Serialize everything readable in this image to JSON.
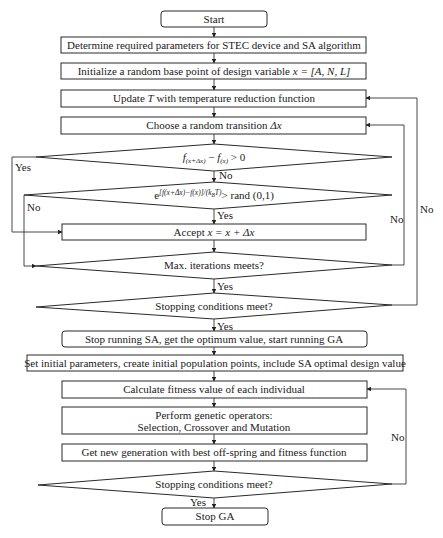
{
  "diagram": {
    "type": "flowchart",
    "nodes": {
      "start": {
        "label": "Start",
        "shape": "terminal"
      },
      "determine_params": {
        "label": "Determine required parameters for STEC device and SA algorithm",
        "shape": "process"
      },
      "initialize": {
        "label_prefix": "Initialize a random base point of design variable ",
        "label_var": "x = [A, N, L]",
        "shape": "process"
      },
      "update_t": {
        "label_prefix": "Update ",
        "label_var": "T",
        "label_suffix": " with temperature reduction function",
        "shape": "process"
      },
      "choose_transition": {
        "label_prefix": "Choose a random transition ",
        "label_var": "Δx",
        "shape": "process"
      },
      "decision_f": {
        "label_f1": "f",
        "label_sub1": "(x+Δx)",
        "label_minus": " − ",
        "label_f2": "f",
        "label_sub2": "(x)",
        "label_tail": " > 0",
        "shape": "decision"
      },
      "decision_exp": {
        "label_e": "e",
        "label_exp": "[f(x+Δx)−f(x)]/(k",
        "label_exp_sub": "B",
        "label_exp_tail": "T)",
        "label_tail": "> rand (0,1)",
        "shape": "decision"
      },
      "accept": {
        "label_prefix": "Accept ",
        "label_var": "x = x + Δx",
        "shape": "process"
      },
      "max_iter": {
        "label": "Max. iterations meets?",
        "shape": "decision"
      },
      "stop_cond_sa": {
        "label": "Stopping conditions meet?",
        "shape": "decision"
      },
      "stop_sa": {
        "label": "Stop running SA, get the optimum value, start running GA",
        "shape": "terminal"
      },
      "set_initial": {
        "label": "Set initial parameters, create initial population points, include SA optimal design value",
        "shape": "process"
      },
      "calc_fitness": {
        "label": "Calculate fitness value of each individual",
        "shape": "process"
      },
      "genetic_ops": {
        "label_line1": "Perform genetic operators:",
        "label_line2": "Selection, Crossover and Mutation",
        "shape": "process"
      },
      "new_generation": {
        "label": "Get new generation with best off-spring and fitness function",
        "shape": "process"
      },
      "stop_cond_ga": {
        "label": "Stopping conditions meet?",
        "shape": "decision"
      },
      "stop_ga": {
        "label": "Stop GA",
        "shape": "terminal"
      }
    },
    "edge_labels": {
      "decision_f_yes": "Yes",
      "decision_f_no": "No",
      "decision_exp_no": "No",
      "decision_exp_yes": "Yes",
      "max_iter_no": "No",
      "max_iter_yes": "Yes",
      "stop_cond_sa_no": "No",
      "stop_cond_sa_yes": "Yes",
      "stop_cond_ga_no": "No",
      "stop_cond_ga_yes": "Yes"
    },
    "edges": [
      {
        "from": "start",
        "to": "determine_params"
      },
      {
        "from": "determine_params",
        "to": "initialize"
      },
      {
        "from": "initialize",
        "to": "update_t"
      },
      {
        "from": "update_t",
        "to": "choose_transition"
      },
      {
        "from": "choose_transition",
        "to": "decision_f"
      },
      {
        "from": "decision_f",
        "to": "decision_exp",
        "label": "No"
      },
      {
        "from": "decision_f",
        "to": "accept",
        "label": "Yes"
      },
      {
        "from": "decision_exp",
        "to": "accept",
        "label": "Yes"
      },
      {
        "from": "decision_exp",
        "to": "max_iter",
        "label": "No"
      },
      {
        "from": "accept",
        "to": "max_iter"
      },
      {
        "from": "max_iter",
        "to": "choose_transition",
        "label": "No"
      },
      {
        "from": "max_iter",
        "to": "stop_cond_sa",
        "label": "Yes"
      },
      {
        "from": "stop_cond_sa",
        "to": "update_t",
        "label": "No"
      },
      {
        "from": "stop_cond_sa",
        "to": "stop_sa",
        "label": "Yes"
      },
      {
        "from": "stop_sa",
        "to": "set_initial"
      },
      {
        "from": "set_initial",
        "to": "calc_fitness"
      },
      {
        "from": "calc_fitness",
        "to": "genetic_ops"
      },
      {
        "from": "genetic_ops",
        "to": "new_generation"
      },
      {
        "from": "new_generation",
        "to": "stop_cond_ga"
      },
      {
        "from": "stop_cond_ga",
        "to": "calc_fitness",
        "label": "No"
      },
      {
        "from": "stop_cond_ga",
        "to": "stop_ga",
        "label": "Yes"
      }
    ]
  },
  "colors": {
    "stroke": "#2a2a2a",
    "text": "#1a1a1a",
    "background": "#ffffff"
  }
}
